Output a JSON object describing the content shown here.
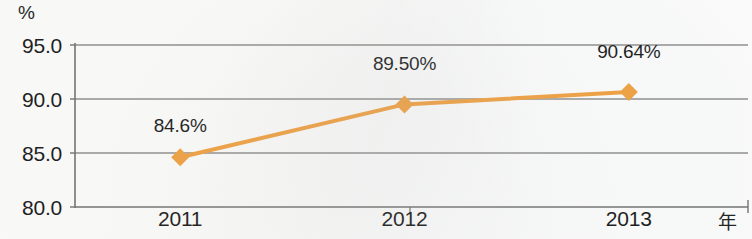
{
  "chart_data": {
    "type": "line",
    "title": "",
    "subtitle": "",
    "xlabel": "年",
    "ylabel": "%",
    "categories": [
      "2011",
      "2012",
      "2013"
    ],
    "x": [
      2011,
      2012,
      2013
    ],
    "series": [
      {
        "name": "",
        "values": [
          84.6,
          89.5,
          90.64
        ],
        "point_labels": [
          "84.6%",
          "89.50%",
          "90.64%"
        ],
        "color": "#f2a03e",
        "marker": "diamond"
      }
    ],
    "ylim": [
      80.0,
      95.0
    ],
    "ytick_labels": [
      "95.0",
      "90.0",
      "85.0",
      "80.0"
    ],
    "ytick_values": [
      95.0,
      90.0,
      85.0,
      80.0
    ],
    "xtick_labels": [
      "2011",
      "2012",
      "2013"
    ],
    "grid": true,
    "grid_axis": "y",
    "grid_color": "#8d8d8d",
    "legend": false,
    "legend_position": "none"
  },
  "axes": {
    "y_unit": "%",
    "x_unit": "年"
  },
  "colors": {
    "series_orange": "#f2a03e",
    "gridline": "#8d8d8d",
    "axis": "#6f6f6f",
    "text": "#141414",
    "background": "#fdfdfc"
  }
}
